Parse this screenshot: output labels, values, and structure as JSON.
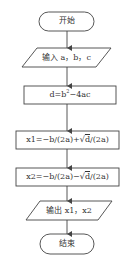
{
  "flowchart": {
    "start": {
      "label": "开始"
    },
    "input": {
      "label": "输入 a，b，c"
    },
    "step_d": {
      "label_prefix": "d=b",
      "label_sup": "2",
      "label_suffix": "−4ac"
    },
    "step_x1": {
      "label_prefix": "x1=−b/(2a)+√",
      "label_rad": "d",
      "label_suffix": "/(2a)"
    },
    "step_x2": {
      "label_prefix": "x2=−b/(2a)−√",
      "label_rad": "d",
      "label_suffix": "/(2a)"
    },
    "output": {
      "label": "输出 x1，x2"
    },
    "end": {
      "label": "结束"
    }
  },
  "colors": {
    "stroke": "#444444",
    "text": "#333333",
    "background": "#ffffff"
  }
}
